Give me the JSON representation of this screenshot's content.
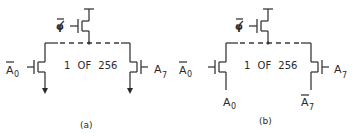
{
  "figure": {
    "panels": [
      {
        "id": "a",
        "caption": "(a)",
        "center_text": "1 OF 256",
        "clock_label": "φ",
        "left_gate_label": "A",
        "left_gate_sub": "0",
        "left_gate_inverted": true,
        "right_gate_label": "A",
        "right_gate_sub": "7",
        "right_gate_inverted": false,
        "outputs": "arrows"
      },
      {
        "id": "b",
        "caption": "(b)",
        "center_text": "1 OF 256",
        "clock_label": "φ",
        "left_gate_label": "A",
        "left_gate_sub": "0",
        "left_gate_inverted": true,
        "right_gate_label": "A",
        "right_gate_sub": "7",
        "right_gate_inverted": false,
        "left_source_label": "A",
        "left_source_sub": "0",
        "left_source_inverted": false,
        "right_source_label": "A",
        "right_source_sub": "7",
        "right_source_inverted": true,
        "outputs": "address-lines"
      }
    ],
    "colors": {
      "ink": "#2a2a2a",
      "background": "#ffffff"
    }
  }
}
